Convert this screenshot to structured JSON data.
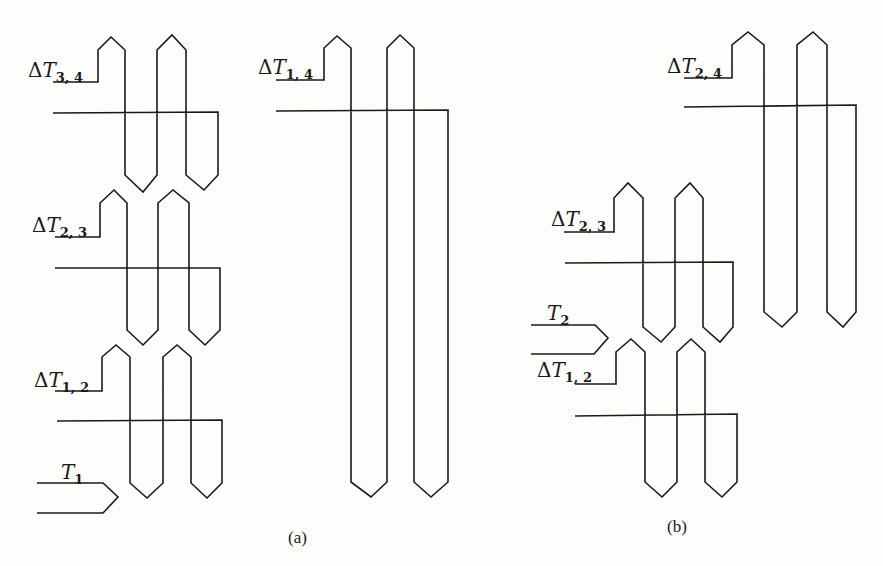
{
  "figure": {
    "panels": [
      {
        "id": "a",
        "caption": "(a)",
        "exchangers": [
          {
            "label_delta": "Δ",
            "label_var": "T",
            "label_sub": "3, 4",
            "description": "first-stage exchanger ΔT3,4"
          },
          {
            "label_delta": "Δ",
            "label_var": "T",
            "label_sub": "2, 3",
            "description": "exchanger ΔT2,3"
          },
          {
            "label_delta": "Δ",
            "label_var": "T",
            "label_sub": "1, 2",
            "description": "exchanger ΔT1,2"
          },
          {
            "label_delta": "Δ",
            "label_var": "T",
            "label_sub": "1, 4",
            "description": "single long exchanger ΔT1,4"
          }
        ],
        "inlet": {
          "label_var": "T",
          "label_sub": "1"
        }
      },
      {
        "id": "b",
        "caption": "(b)",
        "exchangers": [
          {
            "label_delta": "Δ",
            "label_var": "T",
            "label_sub": "2, 4",
            "description": "exchanger ΔT2,4"
          },
          {
            "label_delta": "Δ",
            "label_var": "T",
            "label_sub": "2, 3",
            "description": "exchanger ΔT2,3"
          },
          {
            "label_delta": "Δ",
            "label_var": "T",
            "label_sub": "1, 2",
            "description": "exchanger ΔT1,2"
          }
        ],
        "inlet": {
          "label_var": "T",
          "label_sub": "2"
        }
      }
    ],
    "colors": {
      "stroke": "#1a1a1a",
      "background": "#fdfdfc"
    }
  }
}
